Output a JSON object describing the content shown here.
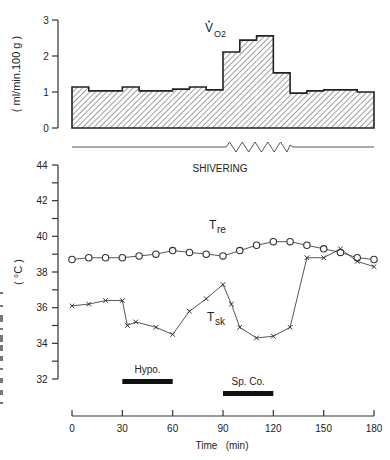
{
  "chart_data": [
    {
      "id": "vo2",
      "type": "bar",
      "title": "V̇O2",
      "title_main": "V",
      "title_sub": "O2",
      "ylabel": "( ml/min.100 g )",
      "xlabel": "",
      "ylim": [
        0,
        3
      ],
      "yticks": [
        0,
        1,
        2,
        3
      ],
      "xlim": [
        0,
        180
      ],
      "fill_pattern": "diagonal-hatch",
      "bins": [
        {
          "start": 0,
          "end": 10,
          "value": 1.14
        },
        {
          "start": 10,
          "end": 30,
          "value": 1.03
        },
        {
          "start": 30,
          "end": 40,
          "value": 1.14
        },
        {
          "start": 40,
          "end": 60,
          "value": 1.03
        },
        {
          "start": 60,
          "end": 70,
          "value": 1.08
        },
        {
          "start": 70,
          "end": 80,
          "value": 1.14
        },
        {
          "start": 80,
          "end": 90,
          "value": 1.06
        },
        {
          "start": 90,
          "end": 100,
          "value": 2.11
        },
        {
          "start": 100,
          "end": 110,
          "value": 2.44
        },
        {
          "start": 110,
          "end": 120,
          "value": 2.56
        },
        {
          "start": 120,
          "end": 130,
          "value": 1.53
        },
        {
          "start": 130,
          "end": 140,
          "value": 0.97
        },
        {
          "start": 140,
          "end": 150,
          "value": 1.03
        },
        {
          "start": 150,
          "end": 170,
          "value": 1.06
        },
        {
          "start": 170,
          "end": 180,
          "value": 1.0
        }
      ]
    },
    {
      "id": "shivering",
      "type": "line",
      "label": "SHIVERING",
      "xlim": [
        0,
        180
      ],
      "zigzag_range": [
        92,
        130
      ]
    },
    {
      "id": "temperature",
      "type": "line",
      "xlabel": "Time   (min)",
      "ylabel": "( °C )",
      "xlim": [
        0,
        180
      ],
      "ylim": [
        32,
        44
      ],
      "xticks": [
        0,
        30,
        60,
        90,
        120,
        150,
        180
      ],
      "yticks": [
        32,
        34,
        36,
        38,
        40,
        42,
        44
      ],
      "yminor": [
        33,
        35,
        37,
        39,
        41,
        43
      ],
      "grid": false,
      "series": [
        {
          "name": "Tre",
          "name_main": "T",
          "name_sub": "re",
          "marker": "circle",
          "x": [
            0,
            10,
            20,
            30,
            40,
            50,
            60,
            70,
            80,
            90,
            100,
            110,
            120,
            130,
            140,
            150,
            160,
            170,
            180
          ],
          "y": [
            38.7,
            38.8,
            38.8,
            38.8,
            38.9,
            39.0,
            39.2,
            39.1,
            39.0,
            38.9,
            39.2,
            39.5,
            39.7,
            39.7,
            39.5,
            39.3,
            39.1,
            38.8,
            38.7
          ]
        },
        {
          "name": "Tsk",
          "name_main": "T",
          "name_sub": "sk",
          "marker": "x",
          "x": [
            0,
            10,
            20,
            30,
            33,
            38,
            50,
            60,
            70,
            80,
            90,
            95,
            100,
            110,
            120,
            130,
            140,
            150,
            160,
            170,
            180
          ],
          "y": [
            36.1,
            36.2,
            36.4,
            36.4,
            35.0,
            35.2,
            34.9,
            34.5,
            35.8,
            36.5,
            37.3,
            36.2,
            34.9,
            34.3,
            34.4,
            34.9,
            38.8,
            38.8,
            39.3,
            38.6,
            38.3
          ]
        }
      ],
      "annotations": [
        {
          "label": "Hypo.",
          "start": 30,
          "end": 60,
          "level": 1
        },
        {
          "label": "Sp. Co.",
          "start": 90,
          "end": 120,
          "level": 2
        }
      ]
    }
  ]
}
